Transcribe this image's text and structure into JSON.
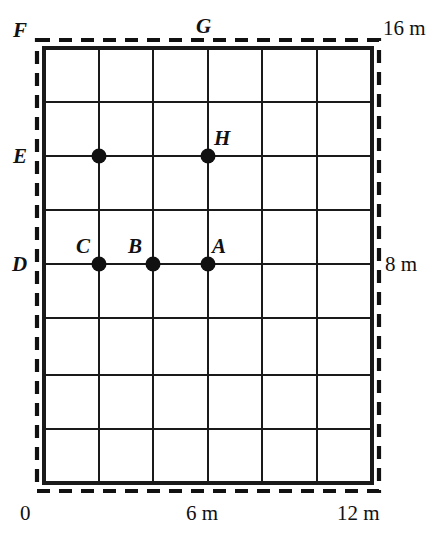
{
  "figure": {
    "units": "m",
    "colors": {
      "ink": "#111111",
      "background": "#ffffff",
      "grid_line": "#1a1a1a",
      "dashed_boundary": "#111111",
      "point_fill": "#111111"
    }
  },
  "grid": {
    "columns": 6,
    "rows": 8,
    "x_lines": [
      44,
      99,
      153,
      208,
      262,
      317,
      372
    ],
    "y_lines": [
      48,
      102,
      156,
      210,
      264,
      318,
      375,
      429,
      483
    ],
    "stroke_width": 2.6,
    "boundary_stroke_width": 3.4
  },
  "boundary": {
    "dash_pattern": "13 9",
    "stroke_width": 4.2,
    "x_left": 37,
    "x_right": 379,
    "y_top": 40,
    "y_bottom": 491
  },
  "points": [
    {
      "id": "E-marker",
      "label": "",
      "x": 99,
      "y": 156
    },
    {
      "id": "H",
      "label": "H",
      "x": 208,
      "y": 156
    },
    {
      "id": "C",
      "label": "C",
      "x": 99,
      "y": 264
    },
    {
      "id": "B",
      "label": "B",
      "x": 153,
      "y": 264
    },
    {
      "id": "A",
      "label": "A",
      "x": 208,
      "y": 264
    }
  ],
  "point_labels": [
    {
      "name": "label-H",
      "text": "H",
      "left": 214,
      "top": 128
    },
    {
      "name": "label-C",
      "text": "C",
      "left": 76,
      "top": 236
    },
    {
      "name": "label-B",
      "text": "B",
      "left": 128,
      "top": 236
    },
    {
      "name": "label-A",
      "text": "A",
      "left": 212,
      "top": 236
    }
  ],
  "corner_labels": [
    {
      "name": "label-F",
      "text": "F",
      "left": 13,
      "top": 20
    },
    {
      "name": "label-G",
      "text": "G",
      "left": 196,
      "top": 16
    },
    {
      "name": "label-E",
      "text": "E",
      "left": 13,
      "top": 146
    },
    {
      "name": "label-D",
      "text": "D",
      "left": 12,
      "top": 254
    }
  ],
  "axis_labels": {
    "top_right": {
      "name": "axis-label-16m",
      "text": "16 m",
      "left": 383,
      "top": 18
    },
    "middle_right": {
      "name": "axis-label-8m",
      "text": "8 m",
      "left": 385,
      "top": 254
    },
    "bottom_left": {
      "name": "axis-label-0",
      "text": "0",
      "left": 20,
      "top": 503
    },
    "bottom_middle": {
      "name": "axis-label-6m",
      "text": "6 m",
      "left": 186,
      "top": 503
    },
    "bottom_right": {
      "name": "axis-label-12m",
      "text": "12 m",
      "left": 337,
      "top": 503
    }
  },
  "chart_data": {
    "type": "scatter",
    "title": "",
    "xlabel": "",
    "ylabel": "",
    "xlim": [
      0,
      12
    ],
    "ylim": [
      0,
      16
    ],
    "xticks": [
      0,
      6,
      12
    ],
    "xticklabels": [
      "0",
      "6 m",
      "12 m"
    ],
    "yticks": [
      8,
      16
    ],
    "yticklabels": [
      "8 m",
      "16 m"
    ],
    "grid": true,
    "grid_spacing_x": 2,
    "grid_spacing_y": 2,
    "legend": "none",
    "points": [
      {
        "label": "",
        "x": 2,
        "y": 12
      },
      {
        "label": "H",
        "x": 6,
        "y": 12
      },
      {
        "label": "C",
        "x": 2,
        "y": 8
      },
      {
        "label": "B",
        "x": 4,
        "y": 8
      },
      {
        "label": "A",
        "x": 6,
        "y": 8
      }
    ],
    "boundary_corner_labels": [
      "F",
      "G",
      "E",
      "D"
    ]
  }
}
